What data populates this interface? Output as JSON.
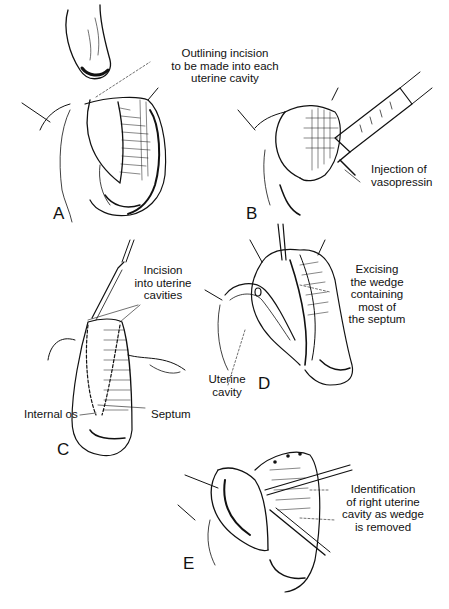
{
  "figure": {
    "panels": [
      {
        "id": "A",
        "letter": "A",
        "labels": [
          {
            "key": "outlining",
            "lines": [
              "Outlining incision",
              "to be made into each",
              "uterine cavity"
            ]
          }
        ]
      },
      {
        "id": "B",
        "letter": "B",
        "labels": [
          {
            "key": "injection",
            "lines": [
              "Injection of",
              "vasopressin"
            ]
          }
        ]
      },
      {
        "id": "C",
        "letter": "C",
        "labels": [
          {
            "key": "incision",
            "lines": [
              "Incision",
              "into uterine",
              "cavities"
            ]
          },
          {
            "key": "internal_os",
            "lines": [
              "Internal os"
            ]
          },
          {
            "key": "septum",
            "lines": [
              "Septum"
            ]
          }
        ]
      },
      {
        "id": "D",
        "letter": "D",
        "labels": [
          {
            "key": "excising",
            "lines": [
              "Excising",
              "the wedge",
              "containing",
              "most of",
              "the septum"
            ]
          },
          {
            "key": "uterine_cavity",
            "lines": [
              "Uterine",
              "cavity"
            ]
          }
        ]
      },
      {
        "id": "E",
        "letter": "E",
        "labels": [
          {
            "key": "identification",
            "lines": [
              "Identification",
              "of right uterine",
              "cavity as wedge",
              "is removed"
            ]
          }
        ]
      }
    ],
    "colors": {
      "ink": "#111111",
      "background": "#ffffff"
    }
  }
}
